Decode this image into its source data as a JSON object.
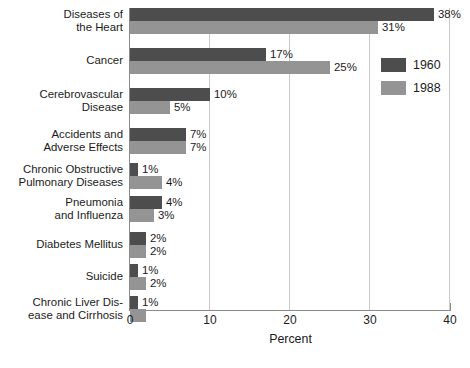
{
  "chart_data": {
    "type": "bar",
    "orientation": "horizontal",
    "title": "",
    "xlabel": "Percent",
    "ylabel": "",
    "xlim": [
      0,
      40
    ],
    "xticks": [
      0,
      10,
      20,
      30,
      40
    ],
    "grid": true,
    "legend_position": "right",
    "categories": [
      "Diseases of\nthe Heart",
      "Cancer",
      "Cerebrovascular\nDisease",
      "Accidents and\nAdverse Effects",
      "Chronic Obstructive\nPulmonary Diseases",
      "Pneumonia\nand  Influenza",
      "Diabetes Mellitus",
      "Suicide",
      "Chronic Liver Dis-\nease and Cirrhosis"
    ],
    "series": [
      {
        "name": "1960",
        "color": "#4d4d4d",
        "values": [
          38,
          17,
          10,
          7,
          1,
          4,
          2,
          1,
          1
        ],
        "labels": [
          "38%",
          "17%",
          "10%",
          "7%",
          "1%",
          "4%",
          "2%",
          "1%",
          "1%"
        ]
      },
      {
        "name": "1988",
        "color": "#949494",
        "values": [
          31,
          25,
          5,
          7,
          4,
          3,
          2,
          2,
          2
        ],
        "labels": [
          "31%",
          "25%",
          "5%",
          "7%",
          "4%",
          "3%",
          "2%",
          "2%",
          ""
        ]
      }
    ]
  },
  "axis": {
    "tick_labels": [
      "0",
      "10",
      "20",
      "30",
      "40"
    ],
    "x_title": "Percent"
  },
  "legend": {
    "entries": [
      {
        "label": "1960",
        "color": "#4d4d4d"
      },
      {
        "label": "1988",
        "color": "#949494"
      }
    ]
  },
  "colors": {
    "series_1960": "#4d4d4d",
    "series_1988": "#949494",
    "gridline": "#c9c9c9",
    "axis": "#8a8a8a",
    "text": "#1b1b1b",
    "background": "#ffffff"
  }
}
